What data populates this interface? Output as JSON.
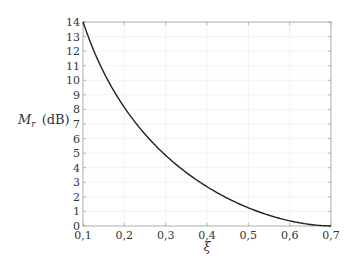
{
  "chart_data": {
    "type": "line",
    "title": "",
    "xlabel": "ξ",
    "ylabel_main": "M",
    "ylabel_sub": "r",
    "ylabel_unit": "(dB)",
    "xlim": [
      0.1,
      0.7
    ],
    "ylim": [
      0,
      14
    ],
    "grid": true,
    "legend": null,
    "x_ticks": [
      "0,1",
      "0,2",
      "0,3",
      "0,4",
      "0,5",
      "0,6",
      "0,7"
    ],
    "y_ticks": [
      "0",
      "1",
      "2",
      "3",
      "4",
      "5",
      "6",
      "7",
      "8",
      "9",
      "10",
      "11",
      "12",
      "13",
      "14"
    ],
    "series": [
      {
        "name": "Mr",
        "color": "#222222",
        "x": [
          0.1,
          0.15,
          0.2,
          0.25,
          0.3,
          0.35,
          0.4,
          0.45,
          0.5,
          0.55,
          0.6,
          0.65,
          0.7
        ],
        "y": [
          14.02,
          10.55,
          8.14,
          6.3,
          4.85,
          3.67,
          2.7,
          1.9,
          1.25,
          0.73,
          0.35,
          0.1,
          0.0
        ]
      }
    ]
  }
}
